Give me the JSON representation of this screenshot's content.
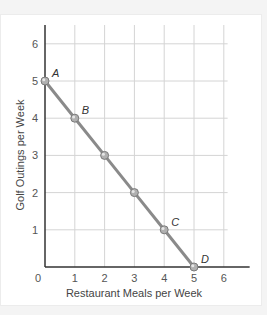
{
  "chart_data": {
    "type": "line",
    "title": "",
    "xlabel": "Restaurant Meals per Week",
    "ylabel": "Golf Outings per Week",
    "xlim": [
      0,
      6.8
    ],
    "ylim": [
      0,
      6.5
    ],
    "x_ticks": [
      0,
      1,
      2,
      3,
      4,
      5,
      6
    ],
    "y_ticks": [
      1,
      2,
      3,
      4,
      5,
      6
    ],
    "grid": true,
    "legend": null,
    "series": [
      {
        "name": "Budget line",
        "x": [
          0,
          1,
          2,
          3,
          4,
          5
        ],
        "y": [
          5,
          4,
          3,
          2,
          1,
          0
        ],
        "color": "#8a8a8a",
        "markers": true
      }
    ],
    "annotations": [
      {
        "label": "A",
        "x": 0,
        "y": 5
      },
      {
        "label": "B",
        "x": 1,
        "y": 4
      },
      {
        "label": "C",
        "x": 4,
        "y": 1
      },
      {
        "label": "D",
        "x": 5,
        "y": 0
      }
    ]
  },
  "colors": {
    "line": "#8a8a8a",
    "marker_fill": "#b0b0b0",
    "marker_stroke": "#7a7a7a",
    "grid": "#d4d4d4",
    "axis": "#333333"
  }
}
